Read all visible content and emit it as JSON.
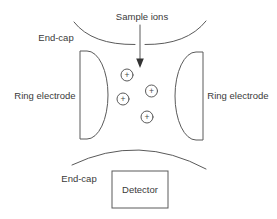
{
  "diagram": {
    "type": "ion-trap-mass-spectrometer-schematic",
    "labels": {
      "sample_ions": "Sample ions",
      "end_cap_top": "End-cap",
      "ring_electrode_left": "Ring electrode",
      "ring_electrode_right": "Ring electrode",
      "end_cap_bottom": "End-cap",
      "detector": "Detector"
    },
    "ions": {
      "symbol": "+",
      "count": 4
    },
    "colors": {
      "line": "#5a5a5a",
      "text": "#3a3a3a",
      "background": "#ffffff"
    }
  }
}
